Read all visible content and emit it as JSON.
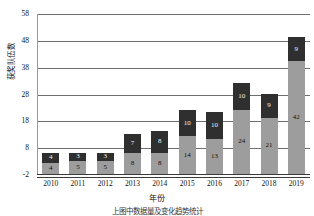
{
  "chart_data": {
    "type": "bar",
    "stacked": true,
    "title": "",
    "xlabel": "年份",
    "ylabel": "获奖队伍数",
    "categories": [
      "2010",
      "2011",
      "2012",
      "2013",
      "2014",
      "2015",
      "2016",
      "2017",
      "2018",
      "2019"
    ],
    "series": [
      {
        "name": "bottom-segment",
        "color": "#9d9d9d",
        "values": [
          4,
          5,
          5,
          8,
          8,
          14,
          13,
          24,
          21,
          42
        ]
      },
      {
        "name": "top-segment",
        "color": "#2f2f2f",
        "values": [
          4,
          3,
          3,
          7,
          8,
          10,
          10,
          10,
          9,
          9
        ]
      }
    ],
    "totals": [
      8,
      8,
      8,
      15,
      16,
      24,
      23,
      34,
      30,
      51
    ],
    "ylim": [
      -2,
      58
    ],
    "yticks": [
      "58",
      "48",
      "38",
      "28",
      "18",
      "8",
      "-2"
    ],
    "ytick_values": [
      58,
      48,
      38,
      28,
      18,
      8,
      -2
    ],
    "grid": true,
    "legend": "none"
  },
  "caption": "上图中数据量及变化趋势统计"
}
